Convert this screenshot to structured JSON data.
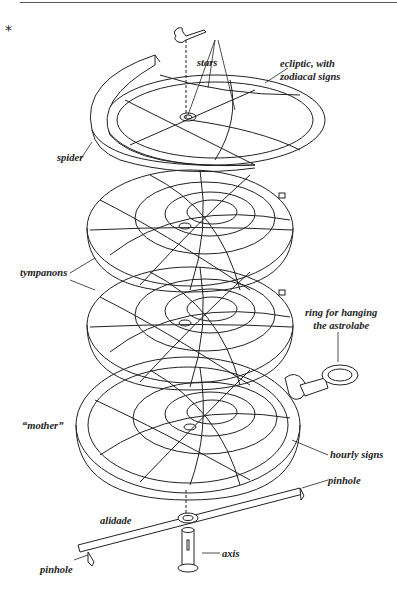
{
  "figure": {
    "marker": "*",
    "parts": {
      "stars": "stars",
      "ecliptic_line1": "ecliptic, with",
      "ecliptic_line2": "zodiacal signs",
      "spider": "spider",
      "tympanons": "tympanons",
      "ring_line1": "ring for hanging",
      "ring_line2": "the astrolabe",
      "mother": "“mother”",
      "hourly_signs": "hourly signs",
      "pinhole_right": "pinhole",
      "alidade": "alidade",
      "axis": "axis",
      "pinhole_left": "pinhole"
    },
    "tympanon_numbers": [
      "60",
      "50",
      "40",
      "30",
      "20",
      "10",
      "80",
      "70"
    ],
    "mother_hour_numbers": [
      "1",
      "2",
      "3",
      "4",
      "5",
      "6",
      "7",
      "8",
      "9",
      "10",
      "11",
      "12",
      "13",
      "14",
      "15",
      "16",
      "17",
      "18",
      "19",
      "20",
      "21",
      "22",
      "23",
      "24"
    ]
  }
}
